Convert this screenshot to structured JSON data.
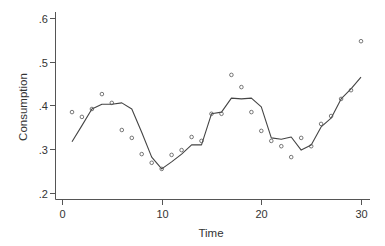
{
  "chart_data": {
    "type": "scatter",
    "title": "",
    "xlabel": "Time",
    "ylabel": "Consumption",
    "xlim": [
      0,
      30
    ],
    "ylim": [
      0.2,
      0.6
    ],
    "grid": false,
    "legend": null,
    "x_ticks": [
      0,
      10,
      20,
      30
    ],
    "x_tick_labels": [
      "0",
      "10",
      "20",
      "30"
    ],
    "y_ticks": [
      0.2,
      0.3,
      0.4,
      0.5,
      0.6
    ],
    "y_tick_labels": [
      ".2",
      ".3",
      ".4",
      ".5",
      ".6"
    ],
    "series": [
      {
        "name": "Observed",
        "kind": "scatter",
        "marker": "hollow-circle",
        "x": [
          1,
          2,
          3,
          4,
          5,
          6,
          7,
          8,
          9,
          10,
          11,
          12,
          13,
          14,
          15,
          16,
          17,
          18,
          19,
          20,
          21,
          22,
          23,
          24,
          25,
          26,
          27,
          28,
          29,
          30
        ],
        "values": [
          0.385,
          0.374,
          0.392,
          0.426,
          0.406,
          0.344,
          0.326,
          0.289,
          0.269,
          0.255,
          0.287,
          0.298,
          0.328,
          0.319,
          0.381,
          0.381,
          0.47,
          0.442,
          0.385,
          0.342,
          0.319,
          0.307,
          0.282,
          0.326,
          0.307,
          0.358,
          0.376,
          0.415,
          0.435,
          0.547
        ]
      },
      {
        "name": "Fitted",
        "kind": "line",
        "x": [
          1,
          2,
          3,
          4,
          5,
          6,
          7,
          8,
          9,
          10,
          11,
          12,
          13,
          14,
          15,
          16,
          17,
          18,
          19,
          20,
          21,
          22,
          23,
          24,
          25,
          26,
          27,
          28,
          29,
          30
        ],
        "values": [
          0.317,
          0.354,
          0.392,
          0.403,
          0.403,
          0.406,
          0.392,
          0.339,
          0.282,
          0.255,
          0.271,
          0.289,
          0.31,
          0.31,
          0.381,
          0.385,
          0.417,
          0.415,
          0.417,
          0.397,
          0.326,
          0.323,
          0.328,
          0.298,
          0.31,
          0.351,
          0.371,
          0.415,
          0.438,
          0.465
        ]
      }
    ]
  },
  "colors": {
    "axis": "#555555",
    "line": "#444444",
    "marker": "#555555",
    "text": "#333333"
  }
}
